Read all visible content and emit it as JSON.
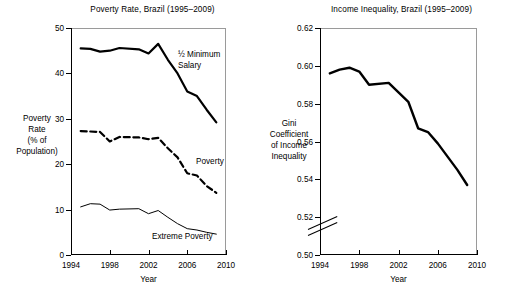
{
  "figure": {
    "background": "#ffffff",
    "line_color": "#000000"
  },
  "panels": {
    "left": {
      "title": "Poverty Rate, Brazil (1995–2009)",
      "ylabel_lines": [
        "Poverty",
        "Rate",
        "(% of",
        "Population)"
      ],
      "xlabel": "Year",
      "yticks": [
        "0",
        "10",
        "20",
        "30",
        "40",
        "50"
      ],
      "xticks": [
        "1994",
        "1998",
        "2002",
        "2006",
        "2010"
      ],
      "series_labels": {
        "minimum_salary": "½ Minimum\nSalary",
        "minimum_salary_line1": "½ Minimum",
        "minimum_salary_line2": "Salary",
        "poverty": "Poverty",
        "extreme_poverty": "Extreme Poverty"
      }
    },
    "right": {
      "title": "Income Inequality, Brazil (1995–2009)",
      "ylabel_lines": [
        "Gini",
        "Coefficient",
        "of Income",
        "Inequality"
      ],
      "xlabel": "Year",
      "yticks": [
        "0.50",
        "0.52",
        "0.54",
        "0.56",
        "0.58",
        "0.60",
        "0.62"
      ],
      "xticks": [
        "1994",
        "1998",
        "2002",
        "2006",
        "2010"
      ],
      "axis_break": true
    }
  },
  "chart_data": [
    {
      "type": "line",
      "title": "Poverty Rate, Brazil (1995–2009)",
      "xlabel": "Year",
      "ylabel": "Poverty Rate (% of Population)",
      "xlim": [
        1994,
        2010
      ],
      "ylim": [
        0,
        50
      ],
      "xticks": [
        1994,
        1998,
        2002,
        2006,
        2010
      ],
      "yticks": [
        0,
        10,
        20,
        30,
        40,
        50
      ],
      "grid": false,
      "legend": "inline-annotations",
      "x": [
        1995,
        1996,
        1997,
        1998,
        1999,
        2001,
        2002,
        2003,
        2004,
        2005,
        2006,
        2007,
        2008,
        2009
      ],
      "series": [
        {
          "name": "½ Minimum Salary",
          "style": "thick-solid",
          "values": [
            45.5,
            45.4,
            44.8,
            45.0,
            45.6,
            45.3,
            44.4,
            46.5,
            43.0,
            40.0,
            36.0,
            35.0,
            32.0,
            29.2
          ]
        },
        {
          "name": "Poverty",
          "style": "thick-dashed",
          "values": [
            27.3,
            27.2,
            27.1,
            25.0,
            26.0,
            25.9,
            25.5,
            25.8,
            23.5,
            21.5,
            18.0,
            17.5,
            15.2,
            13.7
          ]
        },
        {
          "name": "Extreme Poverty",
          "style": "thin-solid",
          "values": [
            10.6,
            11.3,
            11.2,
            9.9,
            10.1,
            10.2,
            9.1,
            9.8,
            8.3,
            6.9,
            5.8,
            5.5,
            5.0,
            4.6
          ]
        }
      ]
    },
    {
      "type": "line",
      "title": "Income Inequality, Brazil (1995–2009)",
      "xlabel": "Year",
      "ylabel": "Gini Coefficient of Income Inequality",
      "xlim": [
        1994,
        2010
      ],
      "ylim": [
        0.5,
        0.62
      ],
      "xticks": [
        1994,
        1998,
        2002,
        2006,
        2010
      ],
      "yticks": [
        0.5,
        0.52,
        0.54,
        0.56,
        0.58,
        0.6,
        0.62
      ],
      "grid": false,
      "axis_break_below": 0.52,
      "x": [
        1995,
        1996,
        1997,
        1998,
        1999,
        2001,
        2002,
        2003,
        2004,
        2005,
        2006,
        2007,
        2008,
        2009
      ],
      "series": [
        {
          "name": "Gini Coefficient",
          "style": "thick-solid",
          "values": [
            0.596,
            0.598,
            0.599,
            0.597,
            0.59,
            0.591,
            0.586,
            0.581,
            0.567,
            0.565,
            0.559,
            0.552,
            0.545,
            0.537
          ]
        }
      ]
    }
  ]
}
